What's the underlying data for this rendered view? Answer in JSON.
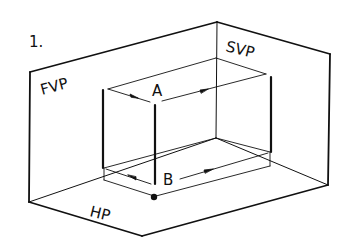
{
  "figure": {
    "number_label": "1.",
    "planes": {
      "fvp_label": "FVP",
      "svp_label": "SVP",
      "hp_label": "HP"
    },
    "dimensions": {
      "top_label": "A",
      "bottom_label": "B"
    }
  },
  "colors": {
    "ink": "#111111",
    "background": "#ffffff"
  }
}
